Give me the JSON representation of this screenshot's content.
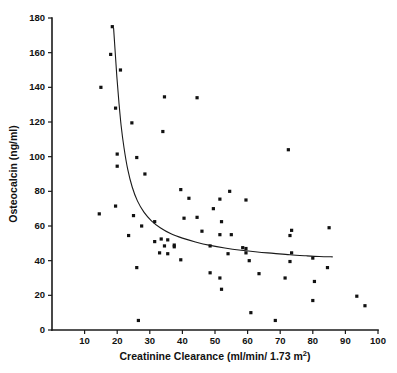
{
  "chart_data": {
    "type": "scatter",
    "title": "",
    "xlabel": "Creatinine Clearance (ml/min/1.73 m2)",
    "xlabel_main": "Creatinine Clearance (ml/min/ 1.73 m",
    "xlabel_sup": "2",
    "xlabel_tail": ")",
    "ylabel": "Osteocalcin  (ng/ml)",
    "xlim": [
      0,
      100
    ],
    "ylim": [
      0,
      180
    ],
    "xticks": [
      10,
      20,
      30,
      40,
      50,
      60,
      70,
      80,
      90,
      100
    ],
    "yticks": [
      0,
      20,
      40,
      60,
      80,
      100,
      120,
      140,
      160,
      180
    ],
    "grid": false,
    "legend": "none",
    "marker": "filled-square",
    "series": [
      {
        "name": "Patients",
        "points": [
          [
            18.5,
            175.0
          ],
          [
            18.0,
            159.0
          ],
          [
            21.0,
            150.0
          ],
          [
            15.0,
            140.0
          ],
          [
            34.5,
            134.5
          ],
          [
            44.5,
            134.0
          ],
          [
            19.5,
            128.0
          ],
          [
            24.5,
            119.5
          ],
          [
            34.0,
            114.5
          ],
          [
            72.5,
            104.0
          ],
          [
            20.0,
            101.5
          ],
          [
            26.0,
            99.5
          ],
          [
            20.0,
            94.5
          ],
          [
            28.5,
            90.0
          ],
          [
            39.5,
            81.0
          ],
          [
            54.5,
            80.0
          ],
          [
            42.0,
            76.0
          ],
          [
            51.5,
            75.5
          ],
          [
            59.5,
            75.0
          ],
          [
            19.5,
            71.5
          ],
          [
            49.5,
            70.0
          ],
          [
            14.5,
            67.0
          ],
          [
            25.0,
            66.0
          ],
          [
            44.5,
            65.0
          ],
          [
            40.5,
            64.5
          ],
          [
            31.5,
            62.5
          ],
          [
            27.5,
            60.0
          ],
          [
            85.0,
            59.0
          ],
          [
            73.5,
            57.5
          ],
          [
            46.0,
            57.0
          ],
          [
            55.0,
            55.0
          ],
          [
            73.0,
            54.5
          ],
          [
            23.5,
            54.5
          ],
          [
            52.0,
            62.5
          ],
          [
            51.5,
            55.0
          ],
          [
            33.5,
            52.5
          ],
          [
            35.5,
            52.0
          ],
          [
            31.5,
            51.0
          ],
          [
            37.5,
            49.0
          ],
          [
            34.5,
            48.5
          ],
          [
            37.5,
            48.0
          ],
          [
            48.5,
            48.5
          ],
          [
            58.5,
            47.5
          ],
          [
            59.5,
            47.0
          ],
          [
            33.0,
            44.5
          ],
          [
            35.5,
            44.0
          ],
          [
            54.0,
            44.0
          ],
          [
            59.5,
            44.5
          ],
          [
            73.5,
            44.5
          ],
          [
            39.5,
            40.5
          ],
          [
            60.5,
            40.0
          ],
          [
            80.0,
            41.5
          ],
          [
            73.0,
            39.5
          ],
          [
            84.5,
            36.0
          ],
          [
            26.0,
            36.0
          ],
          [
            48.5,
            33.0
          ],
          [
            63.5,
            32.5
          ],
          [
            51.5,
            30.0
          ],
          [
            71.5,
            30.0
          ],
          [
            80.5,
            28.0
          ],
          [
            52.0,
            23.5
          ],
          [
            93.5,
            19.5
          ],
          [
            80.0,
            17.0
          ],
          [
            96.0,
            14.0
          ],
          [
            61.0,
            10.0
          ],
          [
            68.5,
            5.5
          ],
          [
            26.5,
            5.5
          ]
        ]
      }
    ],
    "fit_curve": {
      "name": "fitted hyperbolic trend",
      "points": [
        [
          18.9,
          174.0
        ],
        [
          19.4,
          160.0
        ],
        [
          19.9,
          146.0
        ],
        [
          20.5,
          132.0
        ],
        [
          21.2,
          118.0
        ],
        [
          22.1,
          105.0
        ],
        [
          23.2,
          93.0
        ],
        [
          24.6,
          82.5
        ],
        [
          26.2,
          74.5
        ],
        [
          28.2,
          68.0
        ],
        [
          30.5,
          63.0
        ],
        [
          33.2,
          59.0
        ],
        [
          36.5,
          55.5
        ],
        [
          40.0,
          53.0
        ],
        [
          44.0,
          50.8
        ],
        [
          48.5,
          48.8
        ],
        [
          53.0,
          47.3
        ],
        [
          58.0,
          46.0
        ],
        [
          63.0,
          45.0
        ],
        [
          68.0,
          44.2
        ],
        [
          73.0,
          43.4
        ],
        [
          78.0,
          42.8
        ],
        [
          82.0,
          42.4
        ],
        [
          86.0,
          42.2
        ]
      ]
    }
  }
}
